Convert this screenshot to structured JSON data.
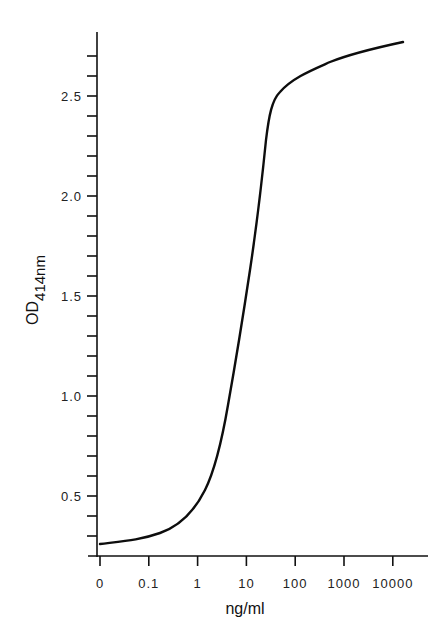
{
  "chart_data": {
    "type": "line",
    "title": "",
    "xlabel": "ng/ml",
    "ylabel": "OD414nm",
    "ylabel_main": "OD",
    "ylabel_sub": "414nm",
    "x_scale": "log (with 0 at origin)",
    "x_ticks": [
      "0",
      "0.1",
      "1",
      "10",
      "100",
      "1000",
      "10000"
    ],
    "y_ticks": [
      "0.5",
      "1.0",
      "1.5",
      "2.0",
      "2.5"
    ],
    "y_minor_step": 0.1,
    "ylim": [
      0.2,
      2.85
    ],
    "grid": false,
    "legend": null,
    "series": [
      {
        "name": "standard curve",
        "x": [
          0,
          0.1,
          0.3,
          1,
          3,
          10,
          20,
          35,
          50,
          100,
          1000,
          5000
        ],
        "y": [
          0.26,
          0.3,
          0.35,
          0.43,
          0.75,
          1.45,
          2.0,
          2.45,
          2.55,
          2.63,
          2.72,
          2.77
        ]
      }
    ]
  },
  "axes": {
    "x_label": "ng/ml",
    "y_label_main": "OD",
    "y_label_sub": "414nm"
  }
}
